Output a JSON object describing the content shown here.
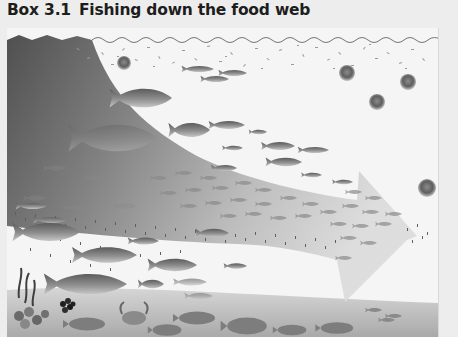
{
  "box": {
    "number": "Box 3.1",
    "title": "Fishing down the food web"
  },
  "illustration": {
    "description": "Ocean cross-section with a large grey arrow sweeping from upper-left (large predatory fish) down to the right (small plankton-feeding fish and jellyfish), illustrating progressive depletion of high trophic-level species",
    "elements": [
      {
        "name": "sea-surface",
        "type": "wavy-line"
      },
      {
        "name": "plankton-layer",
        "type": "speckles",
        "position": "top"
      },
      {
        "name": "trend-arrow",
        "type": "gradient-arrow",
        "direction": "down-right"
      },
      {
        "name": "jellyfish",
        "count": 5
      },
      {
        "name": "large-predatory-fish",
        "position": "upper-left"
      },
      {
        "name": "schooling-forage-fish",
        "position": "center-right"
      },
      {
        "name": "demersal-fish",
        "position": "lower-left"
      },
      {
        "name": "flatfish",
        "position": "seabed"
      },
      {
        "name": "crab",
        "position": "seabed"
      },
      {
        "name": "seaweed",
        "position": "bottom-left"
      },
      {
        "name": "mussels",
        "position": "bottom-left"
      },
      {
        "name": "zooplankton-band",
        "type": "speckles",
        "position": "mid-depth"
      }
    ],
    "colors": {
      "background": "#f5f5f5",
      "arrow_dark": "#4a4a4a",
      "arrow_light": "#cfcfcf",
      "seabed": "#b5b5b5",
      "fish": "#7a7a7a"
    }
  }
}
